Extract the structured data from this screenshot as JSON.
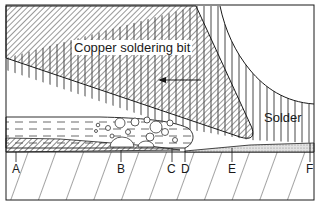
{
  "diagram": {
    "regions": {
      "bit": "Copper soldering bit",
      "solder": "Solder"
    },
    "points": [
      {
        "id": "A",
        "label": "A",
        "x": 16
      },
      {
        "id": "B",
        "label": "B",
        "x": 121
      },
      {
        "id": "C",
        "label": "C",
        "x": 172
      },
      {
        "id": "D",
        "label": "D",
        "x": 185
      },
      {
        "id": "E",
        "label": "E",
        "x": 232
      },
      {
        "id": "F",
        "label": "F",
        "x": 310
      }
    ],
    "arrow": {
      "direction": "left"
    },
    "colors": {
      "ink": "#1a1a1a",
      "background": "#ffffff",
      "hatch": "#333333",
      "stipple": "#bdbdbd"
    }
  }
}
